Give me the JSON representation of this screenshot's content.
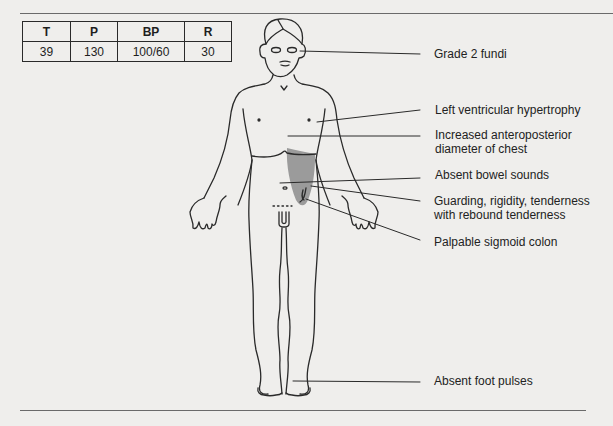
{
  "vitals": {
    "headers": [
      "T",
      "P",
      "BP",
      "R"
    ],
    "values": [
      "39",
      "130",
      "100/60",
      "30"
    ]
  },
  "annotations": [
    {
      "id": "fundi",
      "text": "Grade 2 fundi"
    },
    {
      "id": "lvh",
      "text": "Left ventricular hypertrophy"
    },
    {
      "id": "chest_line1",
      "text": "Increased anteroposterior"
    },
    {
      "id": "chest_line2",
      "text": "diameter of chest"
    },
    {
      "id": "bowel",
      "text": "Absent bowel sounds"
    },
    {
      "id": "guarding_line1",
      "text": "Guarding, rigidity, tenderness"
    },
    {
      "id": "guarding_line2",
      "text": "with rebound tenderness"
    },
    {
      "id": "sigmoid",
      "text": "Palpable sigmoid colon"
    },
    {
      "id": "foot",
      "text": "Absent foot pulses"
    }
  ],
  "colors": {
    "shaded_region": "#9b9b9b",
    "line": "#2a2a2a",
    "background": "#efeeec"
  }
}
